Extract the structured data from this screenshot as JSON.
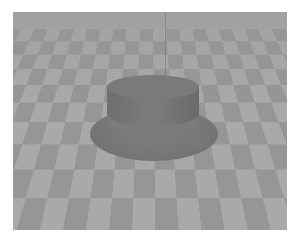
{
  "scene": {
    "description": "Grayscale 3D render of a hat-shaped object resting on a checkerboard floor",
    "object": "hat",
    "floor_pattern": "checkerboard",
    "colors": {
      "background": "#ffffff",
      "tile_light": "#a9a9a9",
      "tile_dark": "#969696",
      "object": "#777777"
    }
  }
}
